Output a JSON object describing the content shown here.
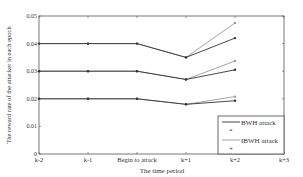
{
  "chart_data": {
    "type": "line",
    "title": "",
    "xlabel": "The time period",
    "ylabel": "The reward rate of the attacker in each epoch",
    "categories": [
      "k-2",
      "k-1",
      "Begin to attack",
      "k+1",
      "k+2",
      "k+3"
    ],
    "ylim": [
      0,
      0.05
    ],
    "yticks": [
      "0",
      "0.01",
      "0.02",
      "0.03",
      "0.04",
      "0.05"
    ],
    "grid": false,
    "legend_position": "lower right",
    "legend": [
      {
        "label": "BWH attack",
        "color": "#333333",
        "marker": "*"
      },
      {
        "label": "IBWH attack",
        "color": "#999999",
        "marker": "+"
      }
    ],
    "series": [
      {
        "name": "BWH attack (high)",
        "group": "BWH attack",
        "values": [
          0.04,
          0.04,
          0.04,
          0.035,
          0.042,
          null
        ]
      },
      {
        "name": "IBWH attack (high)",
        "group": "IBWH attack",
        "values": [
          0.04,
          0.04,
          0.04,
          0.035,
          0.0475,
          null
        ]
      },
      {
        "name": "BWH attack (mid)",
        "group": "BWH attack",
        "values": [
          0.03,
          0.03,
          0.03,
          0.027,
          0.0305,
          null
        ]
      },
      {
        "name": "IBWH attack (mid)",
        "group": "IBWH attack",
        "values": [
          0.03,
          0.03,
          0.03,
          0.027,
          0.0337,
          null
        ]
      },
      {
        "name": "BWH attack (low)",
        "group": "BWH attack",
        "values": [
          0.02,
          0.02,
          0.02,
          0.018,
          0.0193,
          null
        ]
      },
      {
        "name": "IBWH attack (low)",
        "group": "IBWH attack",
        "values": [
          0.02,
          0.02,
          0.02,
          0.018,
          0.0208,
          null
        ]
      }
    ]
  },
  "labels": {
    "xlabel": "The time period",
    "ylabel": "The reward rate of the attacker in each epoch",
    "legend_bwh": "BWH attack",
    "legend_ibwh": "IBWH attack"
  }
}
